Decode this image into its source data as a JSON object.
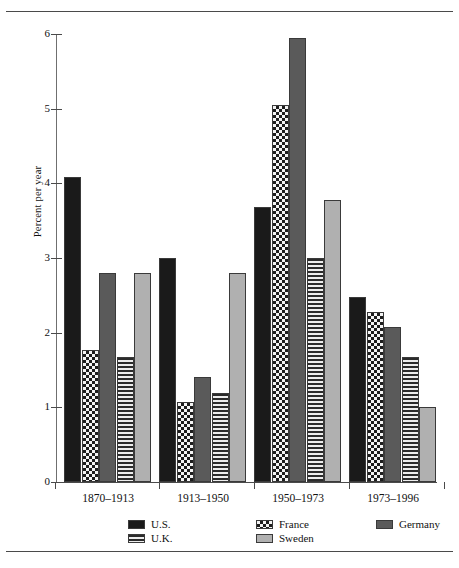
{
  "figure": {
    "y_axis_title": "Percent per year"
  },
  "chart_data": {
    "type": "bar",
    "title": "",
    "xlabel": "",
    "ylabel": "Percent per year",
    "ylim": [
      0,
      6
    ],
    "yticks": [
      0,
      1,
      2,
      3,
      4,
      5,
      6
    ],
    "ytick_labels": [
      "0",
      "1",
      "2",
      "3",
      "4",
      "5",
      "6"
    ],
    "grid": false,
    "legend_position": "bottom",
    "categories": [
      "1870–1913",
      "1913–1950",
      "1950–1973",
      "1973–1996"
    ],
    "series": [
      {
        "name": "U.S.",
        "pattern": "solid-black",
        "color": "#1a1a1a",
        "values": [
          4.08,
          3.0,
          3.68,
          2.48
        ]
      },
      {
        "name": "France",
        "pattern": "checkerboard",
        "color": "#f4f4f4",
        "values": [
          1.77,
          1.07,
          5.05,
          2.28
        ]
      },
      {
        "name": "Germany",
        "pattern": "solid-dark-gray",
        "color": "#5a5a5a",
        "values": [
          2.8,
          1.4,
          5.95,
          2.07
        ]
      },
      {
        "name": "U.K.",
        "pattern": "horizontal-lines",
        "color": "#e9e9e9",
        "values": [
          1.68,
          1.19,
          3.0,
          1.67
        ]
      },
      {
        "name": "Sweden",
        "pattern": "solid-light-gray",
        "color": "#b0b0b0",
        "values": [
          2.8,
          2.8,
          3.78,
          1.0
        ]
      }
    ],
    "legend_entries": [
      {
        "label": "U.S.",
        "pattern": "solid-black"
      },
      {
        "label": "France",
        "pattern": "checkerboard"
      },
      {
        "label": "Germany",
        "pattern": "solid-dark-gray"
      },
      {
        "label": "U.K.",
        "pattern": "horizontal-lines"
      },
      {
        "label": "Sweden",
        "pattern": "solid-light-gray"
      }
    ]
  }
}
